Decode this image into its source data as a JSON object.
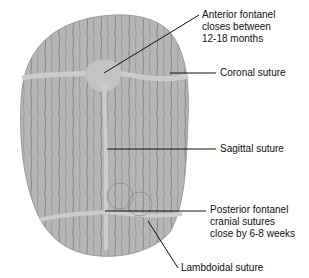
{
  "figure": {
    "labels": {
      "anterior_fontanel": {
        "line1": "Anterior fontanel",
        "line2": "closes between",
        "line3": "12-18 months"
      },
      "coronal_suture": "Coronal suture",
      "sagittal_suture": "Sagittal suture",
      "posterior_fontanel": {
        "line1": "Posterior fontanel",
        "line2": "cranial sutures",
        "line3": "close by 6-8 weeks"
      },
      "lambdoidal_suture": "Lambdoidal suture"
    },
    "colors": {
      "bone": "#b9b9b9",
      "bone_dark": "#8a8a8a",
      "suture": "#c8c8c8",
      "leader": "#111111",
      "text": "#111111"
    }
  }
}
